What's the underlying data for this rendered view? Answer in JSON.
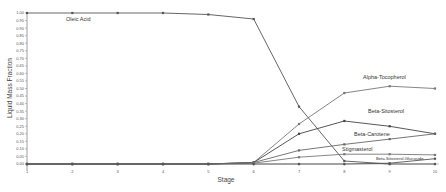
{
  "chart_data": {
    "type": "line",
    "title": "",
    "xlabel": "Stage",
    "ylabel": "Liquid Mass Fraction",
    "x": [
      1,
      2,
      3,
      4,
      5,
      6,
      7,
      8,
      9,
      10
    ],
    "xticks": [
      "1",
      "2",
      "3",
      "4",
      "5",
      "6",
      "7",
      "8",
      "9",
      "10"
    ],
    "ylim": [
      0,
      1.0
    ],
    "yticks": [
      "0.00",
      "0.05",
      "0.10",
      "0.15",
      "0.20",
      "0.25",
      "0.30",
      "0.35",
      "0.40",
      "0.45",
      "0.50",
      "0.55",
      "0.60",
      "0.65",
      "0.70",
      "0.75",
      "0.80",
      "0.85",
      "0.90",
      "0.95",
      "1.00"
    ],
    "grid": false,
    "legend": "inline labels",
    "series": [
      {
        "name": "Oleic Acid",
        "color": "#555555",
        "label_pos": [
          66,
          21
        ],
        "values": [
          1.0,
          1.0,
          1.0,
          1.0,
          0.99,
          0.96,
          0.38,
          0.02,
          0.0,
          0.0
        ]
      },
      {
        "name": "Alpha-Tocopherol",
        "color": "#777777",
        "label_pos": [
          363,
          79
        ],
        "values": [
          0.0,
          0.0,
          0.0,
          0.0,
          0.0,
          0.01,
          0.265,
          0.47,
          0.515,
          0.5
        ]
      },
      {
        "name": "Beta-Sitosterol",
        "color": "#444444",
        "label_pos": [
          368,
          113
        ],
        "values": [
          0.0,
          0.0,
          0.0,
          0.0,
          0.0,
          0.01,
          0.2,
          0.285,
          0.25,
          0.2
        ]
      },
      {
        "name": "Beta-Carotene",
        "color": "#666666",
        "label_pos": [
          354,
          136
        ],
        "values": [
          0.0,
          0.0,
          0.0,
          0.0,
          0.0,
          0.01,
          0.09,
          0.13,
          0.165,
          0.2
        ]
      },
      {
        "name": "Stigmasterol",
        "color": "#777777",
        "label_pos": [
          342,
          151
        ],
        "values": [
          0.0,
          0.0,
          0.0,
          0.0,
          0.0,
          0.005,
          0.045,
          0.065,
          0.065,
          0.06
        ]
      },
      {
        "name": "Beta-Sitosterol-Glucoside",
        "color": "#555555",
        "label_pos": [
          376,
          160
        ],
        "small": true,
        "values": [
          0.0,
          0.0,
          0.0,
          0.0,
          0.0,
          0.0,
          0.0,
          0.0,
          0.005,
          0.035
        ]
      }
    ]
  }
}
